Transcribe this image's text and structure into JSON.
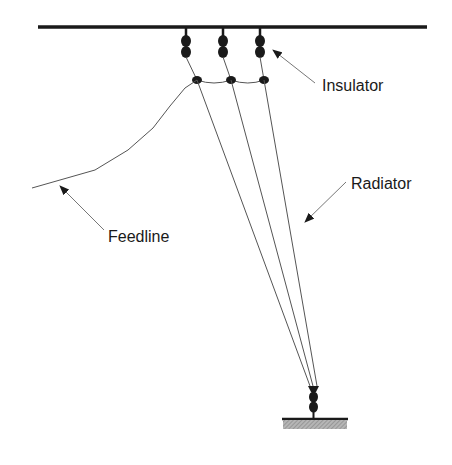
{
  "diagram": {
    "title": "",
    "labels": {
      "insulator": "Insulator",
      "radiator": "Radiator",
      "feedline": "Feedline"
    },
    "colors": {
      "background": "#ffffff",
      "line": "#1a1a1a",
      "wire": "#555555",
      "ground_fill": "#9a9a9a",
      "arrow": "#777777"
    },
    "components": [
      {
        "name": "support-wire",
        "type": "horizontal-support-line"
      },
      {
        "name": "top-insulators",
        "count": 3,
        "type": "egg-insulator-pair"
      },
      {
        "name": "spreader-junctions",
        "count": 3,
        "type": "junction-node"
      },
      {
        "name": "radiator-wires",
        "count": 3,
        "type": "converging-wires"
      },
      {
        "name": "bottom-insulator",
        "type": "egg-insulator-pair"
      },
      {
        "name": "ground-anchor",
        "type": "hatched-ground"
      },
      {
        "name": "feedline",
        "type": "feed-wire"
      }
    ]
  }
}
